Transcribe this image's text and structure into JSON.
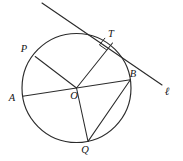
{
  "figure": {
    "kind": "circle-tangent-geometry-diagram",
    "background_color": "#ffffff",
    "ink_color": "#2b2b2b",
    "label_color": "#141414",
    "width": 183,
    "height": 161
  },
  "circle": {
    "name": "circle-O",
    "center_x": 76.5,
    "center_y": 88,
    "radius": 54.5
  },
  "points": {
    "O": {
      "label": "O",
      "x": 76.5,
      "y": 88,
      "label_x": 74,
      "label_y": 99
    },
    "A": {
      "label": "A",
      "x": 22.6,
      "y": 96.2,
      "label_x": 12,
      "label_y": 101
    },
    "B": {
      "label": "B",
      "x": 130.4,
      "y": 79.8,
      "label_x": 133,
      "label_y": 77
    },
    "P": {
      "label": "P",
      "x": 35.2,
      "y": 56.5,
      "label_x": 24,
      "label_y": 52
    },
    "T": {
      "label": "T",
      "x": 112.5,
      "y": 43.0,
      "label_x": 111,
      "label_y": 37
    },
    "Q": {
      "label": "Q",
      "x": 88.0,
      "y": 141.4,
      "label_x": 85,
      "label_y": 153
    }
  },
  "segments": [
    {
      "name": "segment-AB-diameter",
      "from": "A",
      "to": "B"
    },
    {
      "name": "segment-OP-radius",
      "from": "O",
      "to": "P"
    },
    {
      "name": "segment-OT-radius",
      "from": "O",
      "to": "T"
    },
    {
      "name": "segment-QB-chord",
      "from": "Q",
      "to": "B"
    },
    {
      "name": "segment-OQ-radius",
      "from": "O",
      "to": "Q"
    }
  ],
  "tangent_line": {
    "name": "tangent-line-l",
    "label": "ℓ",
    "label_x": 167,
    "label_y": 95,
    "x1": 42,
    "y1": 3,
    "x2": 162,
    "y2": 85,
    "touch_point": "T"
  },
  "right_angle": {
    "name": "right-angle-marker-at-T",
    "at_point": "T",
    "size": 9,
    "indicates": "OT perpendicular to line l"
  }
}
